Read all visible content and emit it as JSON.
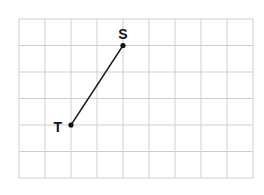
{
  "diagram": {
    "type": "grid-segment",
    "grid": {
      "columns": 9,
      "rows": 6,
      "origin_x": 19,
      "origin_y": 19,
      "cell_width": 26,
      "cell_height": 26.5,
      "line_color": "#cfcfcf"
    },
    "points": [
      {
        "label": "S",
        "grid_x": 4,
        "grid_y": 1,
        "label_position": "above"
      },
      {
        "label": "T",
        "grid_x": 2,
        "grid_y": 4,
        "label_position": "left"
      }
    ],
    "segments": [
      {
        "from": "S",
        "to": "T",
        "color": "#1a1a1a"
      }
    ]
  }
}
